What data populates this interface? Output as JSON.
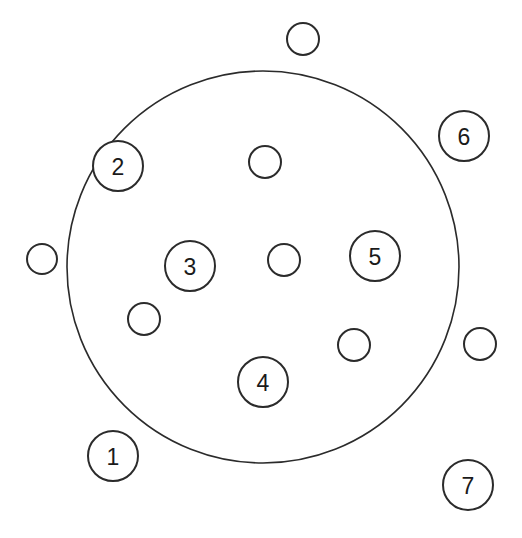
{
  "diagram": {
    "background_color": "#ffffff",
    "stroke_color": "#2b2b2b",
    "fill_color": "#ffffff",
    "canvas": {
      "width": 522,
      "height": 538
    },
    "boundary": {
      "name": "large-boundary-circle",
      "cx": 263,
      "cy": 267,
      "r": 196,
      "stroke_width": 1.6
    },
    "nodes": [
      {
        "id": "node-1",
        "label": "1",
        "cx": 113,
        "cy": 456,
        "r": 25,
        "labeled": true,
        "position": "outside"
      },
      {
        "id": "node-2",
        "label": "2",
        "cx": 118,
        "cy": 166,
        "r": 25,
        "labeled": true,
        "position": "boundary"
      },
      {
        "id": "node-3",
        "label": "3",
        "cx": 190,
        "cy": 266,
        "r": 25,
        "labeled": true,
        "position": "inside"
      },
      {
        "id": "node-4",
        "label": "4",
        "cx": 263,
        "cy": 382,
        "r": 25,
        "labeled": true,
        "position": "inside"
      },
      {
        "id": "node-5",
        "label": "5",
        "cx": 375,
        "cy": 256,
        "r": 25,
        "labeled": true,
        "position": "inside"
      },
      {
        "id": "node-6",
        "label": "6",
        "cx": 464,
        "cy": 136,
        "r": 25,
        "labeled": true,
        "position": "outside"
      },
      {
        "id": "node-7",
        "label": "7",
        "cx": 468,
        "cy": 485,
        "r": 25,
        "labeled": true,
        "position": "outside"
      },
      {
        "id": "node-u1",
        "label": "",
        "cx": 303,
        "cy": 39,
        "r": 16,
        "labeled": false,
        "position": "outside"
      },
      {
        "id": "node-u2",
        "label": "",
        "cx": 42,
        "cy": 259,
        "r": 15,
        "labeled": false,
        "position": "outside"
      },
      {
        "id": "node-u3",
        "label": "",
        "cx": 480,
        "cy": 344,
        "r": 16,
        "labeled": false,
        "position": "outside"
      },
      {
        "id": "node-u4",
        "label": "",
        "cx": 265,
        "cy": 162,
        "r": 16,
        "labeled": false,
        "position": "inside"
      },
      {
        "id": "node-u5",
        "label": "",
        "cx": 284,
        "cy": 260,
        "r": 16,
        "labeled": false,
        "position": "inside"
      },
      {
        "id": "node-u6",
        "label": "",
        "cx": 144,
        "cy": 319,
        "r": 16,
        "labeled": false,
        "position": "inside"
      },
      {
        "id": "node-u7",
        "label": "",
        "cx": 354,
        "cy": 345,
        "r": 16,
        "labeled": false,
        "position": "inside"
      }
    ]
  }
}
